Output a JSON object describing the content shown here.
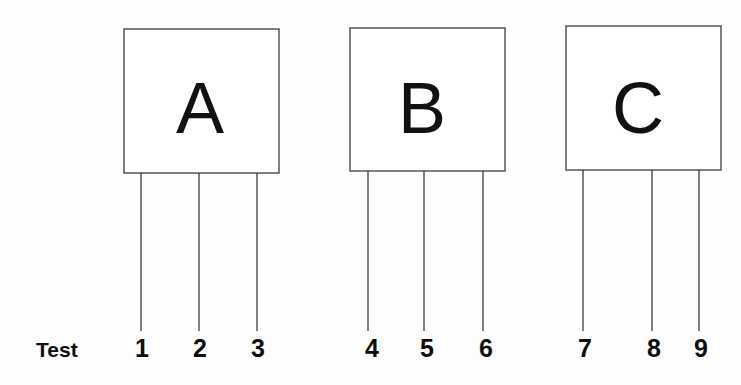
{
  "diagram": {
    "row_label": "Test",
    "colors": {
      "background": "#fdfdfd",
      "box_fill": "#ffffff",
      "box_stroke": "#4a4a4a",
      "pin_stroke": "#3c3c3c",
      "text": "#0d0d0d"
    },
    "blocks": [
      {
        "label": "A",
        "box": {
          "x": 124,
          "y": 29,
          "width": 155,
          "height": 144
        },
        "label_pos": {
          "x": 200,
          "y": 133
        },
        "pins": [
          {
            "number": "1",
            "x": 141,
            "label_x": 142
          },
          {
            "number": "2",
            "x": 199,
            "label_x": 200
          },
          {
            "number": "3",
            "x": 257,
            "label_x": 258
          }
        ]
      },
      {
        "label": "B",
        "box": {
          "x": 350,
          "y": 28,
          "width": 155,
          "height": 143
        },
        "label_pos": {
          "x": 422,
          "y": 133
        },
        "pins": [
          {
            "number": "4",
            "x": 368,
            "label_x": 372
          },
          {
            "number": "5",
            "x": 424,
            "label_x": 427
          },
          {
            "number": "6",
            "x": 483,
            "label_x": 486
          }
        ]
      },
      {
        "label": "C",
        "box": {
          "x": 566,
          "y": 26,
          "width": 155,
          "height": 144
        },
        "label_pos": {
          "x": 638,
          "y": 133
        },
        "pins": [
          {
            "number": "7",
            "x": 583,
            "label_x": 585
          },
          {
            "number": "8",
            "x": 652,
            "label_x": 654
          },
          {
            "number": "9",
            "x": 699,
            "label_x": 701
          }
        ]
      }
    ],
    "pin_geometry": {
      "line_end_y": 331,
      "number_baseline_y": 357
    },
    "row_label_pos": {
      "x": 36,
      "y": 357
    }
  },
  "chart_data": {
    "type": "diagram",
    "row_label": "Test",
    "blocks": [
      "A",
      "B",
      "C"
    ],
    "pins_per_block": 3,
    "pin_numbers": [
      "1",
      "2",
      "3",
      "4",
      "5",
      "6",
      "7",
      "8",
      "9"
    ],
    "mapping": [
      {
        "block": "A",
        "pins": [
          "1",
          "2",
          "3"
        ]
      },
      {
        "block": "B",
        "pins": [
          "4",
          "5",
          "6"
        ]
      },
      {
        "block": "C",
        "pins": [
          "7",
          "8",
          "9"
        ]
      }
    ]
  }
}
